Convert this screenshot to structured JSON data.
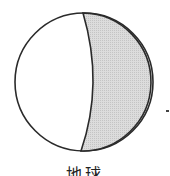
{
  "diagram": {
    "caption": "地球",
    "colors": {
      "outline": "#2a2a2a",
      "lit": "#ffffff",
      "shaded": "#d4d4d4"
    }
  }
}
